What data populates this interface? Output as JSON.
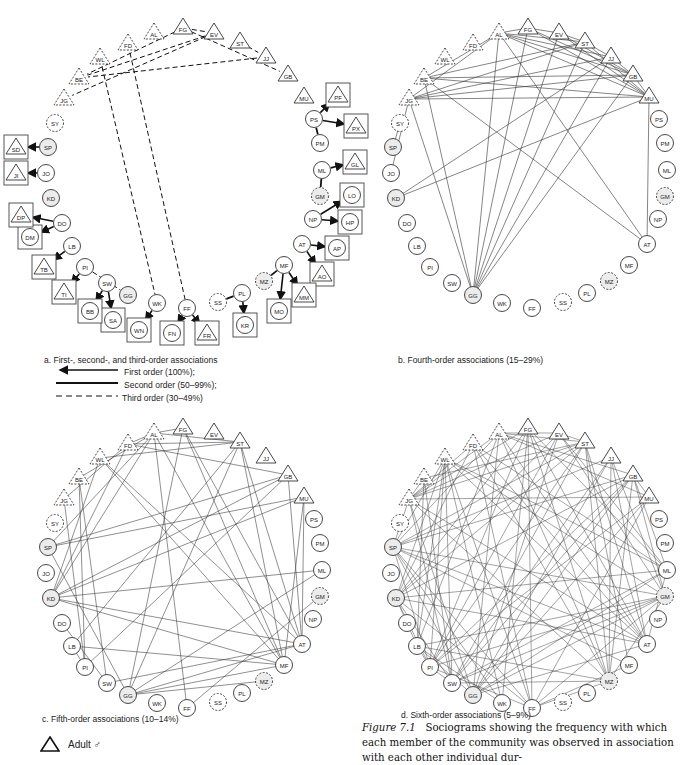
{
  "panels": {
    "a": {
      "label": "a. First-, second-, and third-order associations"
    },
    "b": {
      "label": "b. Fourth-order associations (15–29%)"
    },
    "c": {
      "label": "c. Fifth-order associations (10–14%)"
    },
    "d": {
      "label": "d. Sixth-order associations (5–9%)"
    }
  },
  "legend": {
    "first": "First order (100%);",
    "second": "Second order (50–99%);",
    "third": "Third order (30–49%)"
  },
  "key": {
    "adult_male": "Adult ♂"
  },
  "caption": {
    "figure": "Figure 7.1",
    "text": "Sociograms showing the frequency with which each member of the community was observed in association with each other individual dur-"
  },
  "nodes": [
    {
      "id": "FD",
      "shape": "tri",
      "dashed": true
    },
    {
      "id": "AL",
      "shape": "tri",
      "dashed": true
    },
    {
      "id": "FG",
      "shape": "tri",
      "dashed": false
    },
    {
      "id": "EV",
      "shape": "tri",
      "dashed": false
    },
    {
      "id": "ST",
      "shape": "tri",
      "dashed": false
    },
    {
      "id": "JJ",
      "shape": "tri",
      "dashed": false
    },
    {
      "id": "GB",
      "shape": "tri",
      "dashed": false
    },
    {
      "id": "MU",
      "shape": "tri",
      "dashed": false
    },
    {
      "id": "WL",
      "shape": "tri",
      "dashed": true
    },
    {
      "id": "BE",
      "shape": "tri",
      "dashed": true
    },
    {
      "id": "JG",
      "shape": "tri",
      "dashed": true
    },
    {
      "id": "SY",
      "shape": "circ",
      "dashed": true
    },
    {
      "id": "SP",
      "shape": "circ",
      "dashed": false,
      "grey": true
    },
    {
      "id": "JO",
      "shape": "circ",
      "dashed": false
    },
    {
      "id": "KD",
      "shape": "circ",
      "dashed": false,
      "grey": true
    },
    {
      "id": "DO",
      "shape": "circ",
      "dashed": false
    },
    {
      "id": "LB",
      "shape": "circ",
      "dashed": false
    },
    {
      "id": "PI",
      "shape": "circ",
      "dashed": false
    },
    {
      "id": "SW",
      "shape": "circ",
      "dashed": false
    },
    {
      "id": "GG",
      "shape": "circ",
      "dashed": false,
      "grey": true
    },
    {
      "id": "WK",
      "shape": "circ",
      "dashed": false
    },
    {
      "id": "FF",
      "shape": "circ",
      "dashed": false
    },
    {
      "id": "SS",
      "shape": "circ",
      "dashed": true
    },
    {
      "id": "PL",
      "shape": "circ",
      "dashed": false
    },
    {
      "id": "MZ",
      "shape": "circ",
      "dashed": true,
      "grey": true
    },
    {
      "id": "MF",
      "shape": "circ",
      "dashed": false
    },
    {
      "id": "AT",
      "shape": "circ",
      "dashed": false
    },
    {
      "id": "NP",
      "shape": "circ",
      "dashed": false
    },
    {
      "id": "GM",
      "shape": "circ",
      "dashed": true,
      "grey": true
    },
    {
      "id": "ML",
      "shape": "circ",
      "dashed": false
    },
    {
      "id": "PM",
      "shape": "circ",
      "dashed": false
    },
    {
      "id": "PS",
      "shape": "circ",
      "dashed": false
    }
  ],
  "panel_a": {
    "positions": {
      "FD": [
        128,
        44
      ],
      "AL": [
        154,
        33
      ],
      "FG": [
        183,
        28
      ],
      "EV": [
        214,
        33
      ],
      "ST": [
        240,
        42
      ],
      "JJ": [
        266,
        57
      ],
      "GB": [
        288,
        75
      ],
      "MU": [
        304,
        97
      ],
      "WL": [
        100,
        58
      ],
      "BE": [
        79,
        78
      ],
      "JG": [
        64,
        99
      ],
      "SY": [
        55,
        123
      ],
      "SP": [
        48,
        147
      ],
      "JO": [
        46,
        173
      ],
      "KD": [
        51,
        198
      ],
      "DO": [
        62,
        223
      ],
      "LB": [
        72,
        246
      ],
      "PI": [
        85,
        267
      ],
      "SW": [
        107,
        283
      ],
      "GG": [
        128,
        295
      ],
      "WK": [
        157,
        303
      ],
      "FF": [
        187,
        308
      ],
      "SS": [
        218,
        302
      ],
      "PL": [
        242,
        293
      ],
      "MZ": [
        264,
        281
      ],
      "MF": [
        284,
        265
      ],
      "AT": [
        302,
        244
      ],
      "NP": [
        313,
        219
      ],
      "GM": [
        320,
        196
      ],
      "ML": [
        322,
        170
      ],
      "PM": [
        320,
        143
      ],
      "PS": [
        314,
        119
      ]
    },
    "offspring": [
      {
        "id": "PF",
        "shape": "tri",
        "x": 338,
        "y": 95
      },
      {
        "id": "PX",
        "shape": "tri",
        "x": 356,
        "y": 126
      },
      {
        "id": "GL",
        "shape": "tri",
        "x": 355,
        "y": 162
      },
      {
        "id": "LO",
        "shape": "circ",
        "x": 352,
        "y": 195
      },
      {
        "id": "HP",
        "shape": "circ",
        "x": 350,
        "y": 222
      },
      {
        "id": "AP",
        "shape": "circ",
        "x": 337,
        "y": 248
      },
      {
        "id": "AO",
        "shape": "tri",
        "x": 322,
        "y": 274
      },
      {
        "id": "MM",
        "shape": "tri",
        "x": 304,
        "y": 295
      },
      {
        "id": "MO",
        "shape": "circ",
        "x": 279,
        "y": 311
      },
      {
        "id": "KR",
        "shape": "circ",
        "x": 245,
        "y": 325
      },
      {
        "id": "FR",
        "shape": "tri",
        "x": 207,
        "y": 333
      },
      {
        "id": "FN",
        "shape": "circ",
        "x": 172,
        "y": 333
      },
      {
        "id": "WN",
        "shape": "circ",
        "x": 139,
        "y": 330
      },
      {
        "id": "SA",
        "shape": "circ",
        "x": 113,
        "y": 320
      },
      {
        "id": "BB",
        "shape": "circ",
        "x": 90,
        "y": 311
      },
      {
        "id": "TI",
        "shape": "tri",
        "x": 64,
        "y": 292
      },
      {
        "id": "TB",
        "shape": "tri",
        "x": 44,
        "y": 267
      },
      {
        "id": "DM",
        "shape": "circ",
        "x": 30,
        "y": 237
      },
      {
        "id": "DP",
        "shape": "tri",
        "x": 21,
        "y": 215
      },
      {
        "id": "JI",
        "shape": "tri",
        "x": 16,
        "y": 173
      },
      {
        "id": "SD",
        "shape": "tri",
        "x": 16,
        "y": 147
      }
    ],
    "edges_first": [
      [
        "PS",
        "PF"
      ],
      [
        "PS",
        "PX"
      ],
      [
        "ML",
        "GL"
      ],
      [
        "NP",
        "LO"
      ],
      [
        "NP",
        "HP"
      ],
      [
        "AT",
        "AP"
      ],
      [
        "AT",
        "AO"
      ],
      [
        "MF",
        "MM"
      ],
      [
        "MF",
        "MO"
      ],
      [
        "PL",
        "KR"
      ],
      [
        "FF",
        "FR"
      ],
      [
        "FF",
        "FN"
      ],
      [
        "WK",
        "WN"
      ],
      [
        "SW",
        "SA"
      ],
      [
        "SW",
        "BB"
      ],
      [
        "PI",
        "TI"
      ],
      [
        "LB",
        "TB"
      ],
      [
        "DO",
        "DM"
      ],
      [
        "DO",
        "DP"
      ],
      [
        "JO",
        "JI"
      ],
      [
        "SP",
        "SD"
      ]
    ],
    "edges_second": [
      [
        "PS",
        "PM"
      ],
      [
        "ML",
        "GM"
      ],
      [
        "MF",
        "MZ"
      ],
      [
        "SS",
        "PL"
      ]
    ],
    "edges_third": [
      [
        "FG",
        "EV"
      ],
      [
        "FG",
        "BE"
      ],
      [
        "EV",
        "BE"
      ],
      [
        "EV",
        "JG"
      ],
      [
        "FG",
        "GB"
      ],
      [
        "ST",
        "JJ"
      ],
      [
        "JJ",
        "BE"
      ],
      [
        "WL",
        "WK"
      ],
      [
        "FD",
        "FF"
      ],
      [
        "PI",
        "GG"
      ]
    ]
  },
  "panel_b": {
    "offset": [
      345,
      0
    ],
    "edges": [
      [
        "AL",
        "FG"
      ],
      [
        "FG",
        "EV"
      ],
      [
        "EV",
        "ST"
      ],
      [
        "ST",
        "JJ"
      ],
      [
        "AL",
        "GB"
      ],
      [
        "AL",
        "MU"
      ],
      [
        "AL",
        "JJ"
      ],
      [
        "AL",
        "ST"
      ],
      [
        "FG",
        "GB"
      ],
      [
        "FG",
        "MU"
      ],
      [
        "EV",
        "GB"
      ],
      [
        "EV",
        "MU"
      ],
      [
        "ST",
        "MU"
      ],
      [
        "JJ",
        "GB"
      ],
      [
        "GB",
        "MU"
      ],
      [
        "BE",
        "GB"
      ],
      [
        "BE",
        "MU"
      ],
      [
        "BE",
        "ST"
      ],
      [
        "BE",
        "AL"
      ],
      [
        "JG",
        "MU"
      ],
      [
        "JG",
        "GB"
      ],
      [
        "JG",
        "JJ"
      ],
      [
        "JG",
        "AL"
      ],
      [
        "JG",
        "ST"
      ],
      [
        "JG",
        "JO"
      ],
      [
        "JG",
        "GG"
      ],
      [
        "BE",
        "GG"
      ],
      [
        "AL",
        "GG"
      ],
      [
        "FG",
        "GG"
      ],
      [
        "EV",
        "GG"
      ],
      [
        "ST",
        "GG"
      ],
      [
        "JJ",
        "GG"
      ],
      [
        "GB",
        "GG"
      ],
      [
        "MU",
        "AT"
      ],
      [
        "AL",
        "AT"
      ],
      [
        "BE",
        "AT"
      ],
      [
        "MU",
        "KD"
      ],
      [
        "SY",
        "SP"
      ],
      [
        "JJ",
        "KD"
      ]
    ]
  },
  "panel_c": {
    "offset": [
      0,
      400
    ],
    "edges": [
      [
        "FD",
        "ST"
      ],
      [
        "FD",
        "GB"
      ],
      [
        "AL",
        "FG"
      ],
      [
        "AL",
        "ST"
      ],
      [
        "WL",
        "ST"
      ],
      [
        "FD",
        "AL"
      ],
      [
        "BE",
        "AL"
      ],
      [
        "JG",
        "FD"
      ],
      [
        "KD",
        "AL"
      ],
      [
        "KD",
        "FD"
      ],
      [
        "KD",
        "GB"
      ],
      [
        "KD",
        "MU"
      ],
      [
        "KD",
        "WL"
      ],
      [
        "SP",
        "MU"
      ],
      [
        "SP",
        "GB"
      ],
      [
        "SP",
        "AL"
      ],
      [
        "SP",
        "GG"
      ],
      [
        "BE",
        "PI"
      ],
      [
        "BE",
        "SW"
      ],
      [
        "JG",
        "PI"
      ],
      [
        "FG",
        "MF"
      ],
      [
        "FG",
        "AT"
      ],
      [
        "FG",
        "GG"
      ],
      [
        "AL",
        "MF"
      ],
      [
        "AL",
        "FF"
      ],
      [
        "ST",
        "MF"
      ],
      [
        "ST",
        "AT"
      ],
      [
        "ST",
        "GG"
      ],
      [
        "ST",
        "LB"
      ],
      [
        "GB",
        "AT"
      ],
      [
        "GB",
        "PI"
      ],
      [
        "MU",
        "AT"
      ],
      [
        "MU",
        "MF"
      ],
      [
        "KD",
        "AT"
      ],
      [
        "KD",
        "MF"
      ],
      [
        "KD",
        "ML"
      ],
      [
        "WL",
        "MF"
      ],
      [
        "WL",
        "AT"
      ],
      [
        "GG",
        "AT"
      ],
      [
        "GG",
        "MF"
      ],
      [
        "GG",
        "MZ"
      ],
      [
        "SW",
        "AT"
      ],
      [
        "FF",
        "GM"
      ],
      [
        "LB",
        "PI"
      ],
      [
        "DO",
        "SW"
      ],
      [
        "LB",
        "MF"
      ],
      [
        "ML",
        "GG"
      ]
    ]
  },
  "panel_d": {
    "offset": [
      345,
      400
    ],
    "dense": true
  }
}
